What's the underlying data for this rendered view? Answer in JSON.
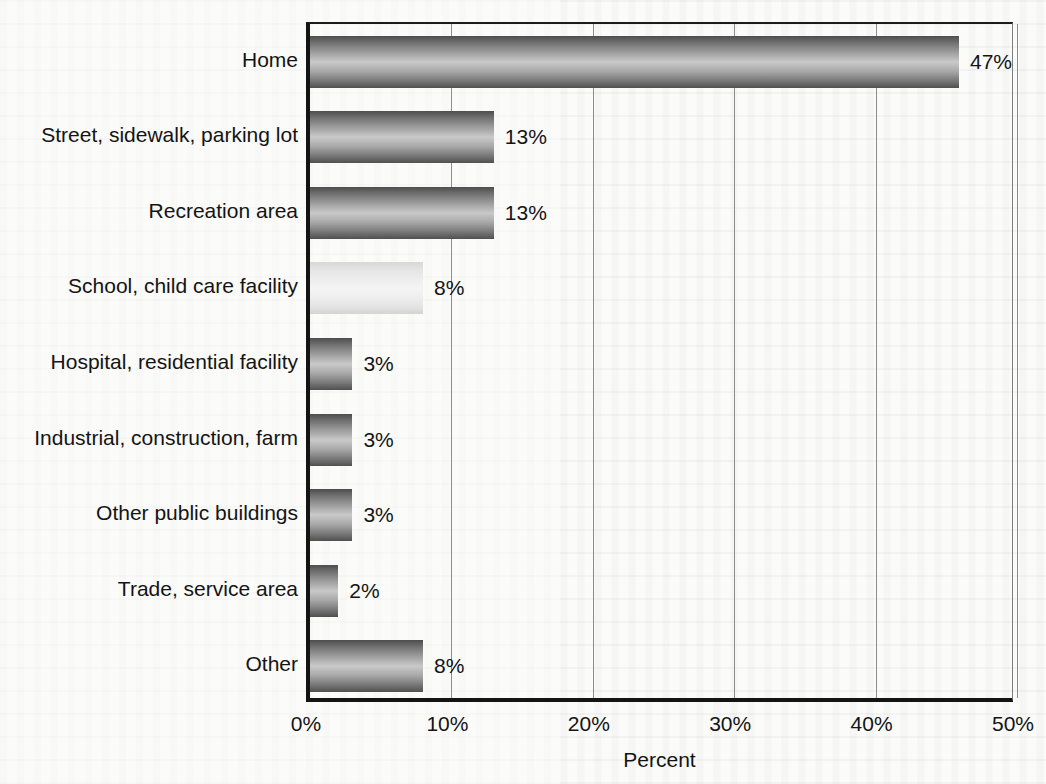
{
  "chart_data": {
    "type": "bar",
    "orientation": "horizontal",
    "title": "",
    "xlabel": "Percent",
    "ylabel": "",
    "xlim": [
      0,
      50
    ],
    "xticks": [
      0,
      10,
      20,
      30,
      40,
      50
    ],
    "xtick_labels": [
      "0%",
      "10%",
      "20%",
      "30%",
      "40%",
      "50%"
    ],
    "grid": "vertical",
    "legend": "none",
    "value_label_suffix": "%",
    "categories": [
      "Home",
      "Street, sidewalk, parking lot",
      "Recreation area",
      "School, child care facility",
      "Hospital, residential facility",
      "Industrial, construction, farm",
      "Other public buildings",
      "Trade, service area",
      "Other"
    ],
    "values": [
      47,
      13,
      13,
      8,
      3,
      3,
      3,
      2,
      8
    ],
    "value_labels": [
      "47%",
      "13%",
      "13%",
      "8%",
      "3%",
      "3%",
      "3%",
      "2%",
      "8%"
    ],
    "bar_styles": [
      "gradient-dark",
      "gradient-dark",
      "gradient-dark",
      "gradient-light",
      "gradient-dark",
      "gradient-dark",
      "gradient-dark",
      "gradient-dark",
      "gradient-dark"
    ]
  },
  "colors": {
    "background": "#fbfbfa",
    "axis": "#141414",
    "gridline": "#8d8d8d",
    "text": "#141414",
    "bar_dark_edge": "#4d4d4d",
    "bar_light_center": "#c9c9c9",
    "bar_pale": "#f4f4f4"
  }
}
